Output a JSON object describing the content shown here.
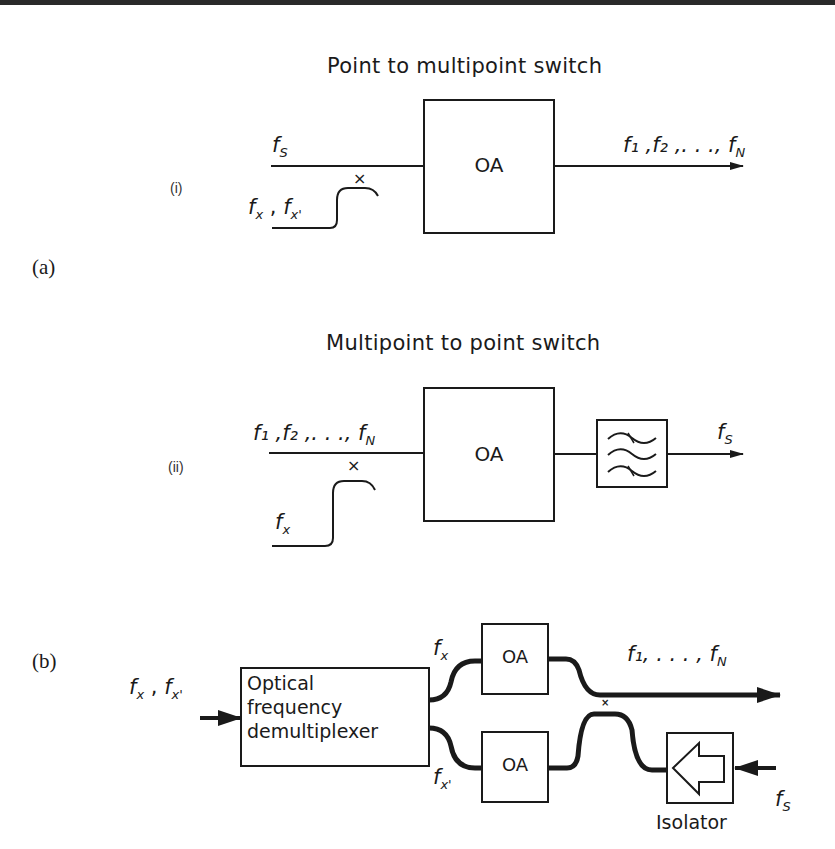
{
  "figure": {
    "panel_a_label": "(a)",
    "panel_b_label": "(b)"
  },
  "diagram_a_i": {
    "label": "(i)",
    "title": "Point to multipoint switch",
    "input_signal": "f",
    "input_signal_sub": "S",
    "control_signal": "f",
    "control_signal_sub": "x",
    "control_signal_2": "f",
    "control_signal_2_sub": "x'",
    "amplifier_label": "OA",
    "coupler_mark": "×",
    "output_signals": "f₁ ,f₂ ,. . ., f",
    "output_signals_sub": "N"
  },
  "diagram_a_ii": {
    "label": "(ii)",
    "title": "Multipoint to point switch",
    "input_signals": "f₁ ,f₂ ,. . ., f",
    "input_signals_sub": "N",
    "control_signal": "f",
    "control_signal_sub": "x",
    "amplifier_label": "OA",
    "coupler_mark": "×",
    "filter_icon": "bandpass-filter-icon",
    "output_signal": "f",
    "output_signal_sub": "S"
  },
  "diagram_b": {
    "input_signals": "f",
    "input_signals_sub": "x",
    "input_signals_2": "f",
    "input_signals_2_sub": "x'",
    "demux_line1": "Optical",
    "demux_line2": "frequency",
    "demux_line3": "demultiplexer",
    "branch_top": "f",
    "branch_top_sub": "x",
    "branch_bottom": "f",
    "branch_bottom_sub": "x'",
    "amplifier_top_label": "OA",
    "amplifier_bottom_label": "OA",
    "coupler_mark": "×",
    "output_signals": "f₁, . . . , f",
    "output_signals_sub": "N",
    "isolator_label": "Isolator",
    "isolator_icon": "left-arrow-icon",
    "return_signal": "f",
    "return_signal_sub": "S"
  }
}
